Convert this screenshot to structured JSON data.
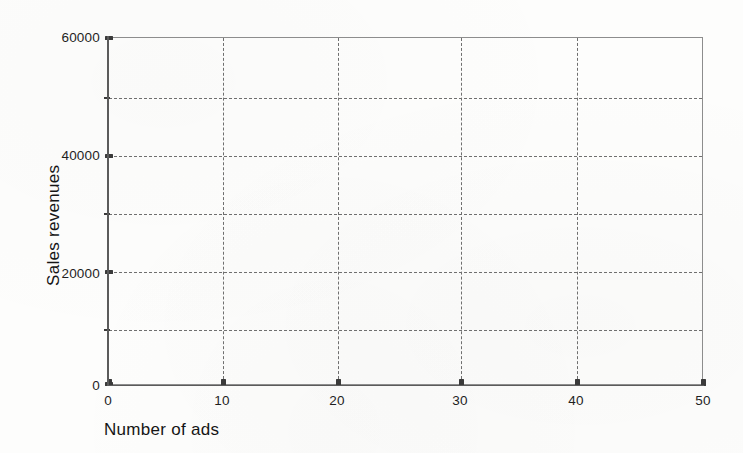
{
  "chart_data": {
    "type": "scatter",
    "title": "",
    "subtitle": "",
    "xlabel": "Number of ads",
    "ylabel": "Sales revenues",
    "xlim": [
      0,
      50
    ],
    "ylim": [
      0,
      60000
    ],
    "x_ticks": [
      0,
      10,
      20,
      30,
      40,
      50
    ],
    "x_tick_labels": [
      "0",
      "10",
      "20",
      "30",
      "40",
      "50"
    ],
    "y_ticks": [
      0,
      10000,
      20000,
      30000,
      40000,
      50000,
      60000
    ],
    "y_tick_labels": [
      "0",
      "",
      "20000",
      "",
      "40000",
      "",
      "60000"
    ],
    "y_labeled_ticks": [
      0,
      20000,
      40000,
      60000
    ],
    "y_minor_ticks": [
      10000,
      30000,
      50000
    ],
    "grid": true,
    "grid_style": "dashed",
    "legend": false,
    "legend_position": "none",
    "series": [
      {
        "name": "",
        "points": []
      }
    ],
    "annotations": [],
    "note": "Empty plotting grid with no data points drawn"
  },
  "axes": {
    "y_title": "Sales revenues",
    "x_title": "Number of ads",
    "y_tick_labels": [
      {
        "value": 60000,
        "text": "60000"
      },
      {
        "value": 50000,
        "text": ""
      },
      {
        "value": 40000,
        "text": "40000"
      },
      {
        "value": 30000,
        "text": ""
      },
      {
        "value": 20000,
        "text": "20000"
      },
      {
        "value": 10000,
        "text": ""
      },
      {
        "value": 0,
        "text": "0"
      }
    ],
    "x_tick_labels": [
      {
        "value": 0,
        "text": "0"
      },
      {
        "value": 10,
        "text": "10"
      },
      {
        "value": 20,
        "text": "20"
      },
      {
        "value": 30,
        "text": "30"
      },
      {
        "value": 40,
        "text": "40"
      },
      {
        "value": 50,
        "text": "50"
      }
    ]
  },
  "colors": {
    "background": "#fdfdfc",
    "axis": "#5b5b5b",
    "grid": "#6f6f6f",
    "text": "#1f1f1f",
    "border": "#8d8d8d"
  }
}
